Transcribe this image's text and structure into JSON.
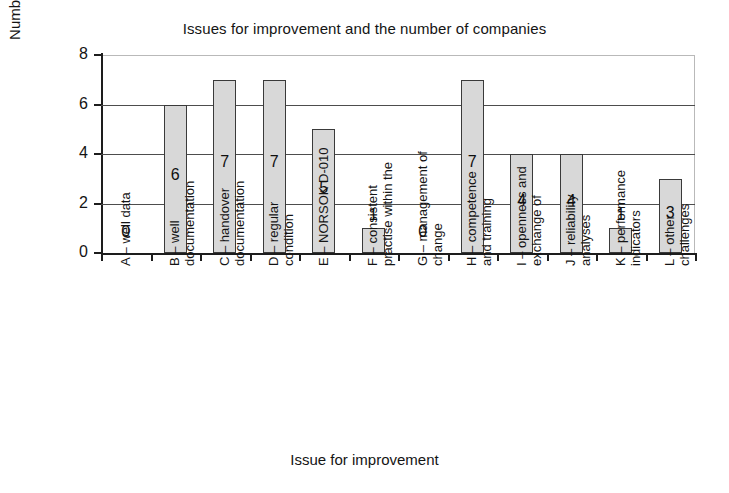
{
  "chart_data": {
    "type": "bar",
    "title": "Issues for improvement and the number of companies",
    "xlabel": "Issue for improvement",
    "ylabel": "Number of companies",
    "ylim": [
      0,
      8
    ],
    "yticks": [
      0,
      2,
      4,
      6,
      8
    ],
    "grid": true,
    "legend": "none",
    "categories": [
      "A – well data",
      "B – well documentation",
      "C – handover documentation",
      "D – regular condition",
      "E – NORSOK D-010",
      "F – consistent practise within the",
      "G – management of change",
      "H – competence and training",
      "I – openness and exchange of",
      "J – reliability analyses",
      "K – performance indicators",
      "L – other challenges"
    ],
    "category_lines": [
      [
        "A – well data"
      ],
      [
        "B – well",
        "documentation"
      ],
      [
        "C – handover",
        "documentation"
      ],
      [
        "D – regular",
        "condition"
      ],
      [
        "E – NORSOK D-010"
      ],
      [
        "F – consistent",
        "practise within the"
      ],
      [
        "G – management of",
        "change"
      ],
      [
        "H – competence",
        "and training"
      ],
      [
        "I – openness and",
        "exchange of"
      ],
      [
        "J – reliability",
        "analyses"
      ],
      [
        "K – performance",
        "indicators"
      ],
      [
        "L – other",
        "challenges"
      ]
    ],
    "values": [
      0,
      6,
      7,
      7,
      5,
      1,
      0,
      7,
      4,
      4,
      1,
      3
    ],
    "data_labels": [
      "0",
      "6",
      "7",
      "7",
      "5",
      "1",
      "0",
      "7",
      "4",
      "4",
      "1",
      "3"
    ],
    "bar_color": "#d8d8d8",
    "bar_border_color": "#3a3a3a",
    "axis_color": "#1d1d1d",
    "grid_color": "#4d4d4d",
    "background": "#ffffff"
  },
  "ytick_labels": [
    "0",
    "2",
    "4",
    "6",
    "8"
  ]
}
